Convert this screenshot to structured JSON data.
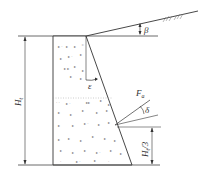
{
  "diagram": {
    "type": "retaining wall earth pressure diagram",
    "labels": {
      "beta": "β",
      "epsilon": "ε",
      "force_main": "F",
      "force_sub": "a",
      "delta": "δ",
      "height_main": "H",
      "height_sub": "t",
      "height_third_main": "H",
      "height_third_sub": "t",
      "height_third_suffix": "/3"
    },
    "colors": {
      "line": "#333333",
      "fill": "#ffffff",
      "hatch": "#666666"
    }
  }
}
